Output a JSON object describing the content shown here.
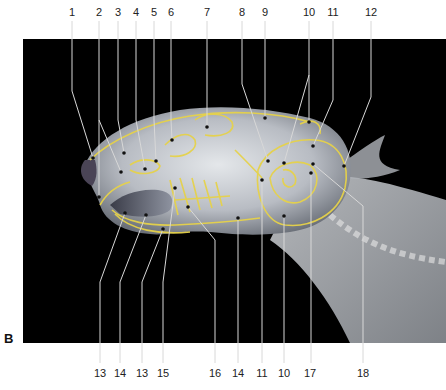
{
  "figure": {
    "panel_letter": "B",
    "colors": {
      "background": "#000000",
      "outline": "#e6d24a",
      "leader": "#d8d8d8",
      "bone_light": "#d9dce0",
      "bone_mid": "#9aa0a8",
      "bone_dark": "#5a5f68"
    },
    "top_labels": [
      {
        "text": "1",
        "x": 72,
        "dot": [
          93,
          158
        ],
        "bend": [
          72,
          91
        ]
      },
      {
        "text": "2",
        "x": 99,
        "dot": [
          121,
          172
        ],
        "bend": [
          99,
          120
        ]
      },
      {
        "text": "3",
        "x": 118,
        "dot": [
          124,
          153
        ],
        "bend": [
          118,
          120
        ]
      },
      {
        "text": "4",
        "x": 136,
        "dot": [
          145,
          169
        ],
        "bend": [
          136,
          120
        ]
      },
      {
        "text": "5",
        "x": 154,
        "dot": [
          156,
          161
        ],
        "bend": [
          154,
          120
        ]
      },
      {
        "text": "6",
        "x": 171,
        "dot": [
          172,
          140
        ],
        "bend": [
          171,
          120
        ]
      },
      {
        "text": "7",
        "x": 207,
        "dot": [
          207,
          127
        ],
        "bend": [
          207,
          120
        ]
      },
      {
        "text": "8",
        "x": 242,
        "dot": [
          268,
          161
        ],
        "bend": [
          242,
          84
        ]
      },
      {
        "text": "9",
        "x": 265,
        "dot": [
          265,
          118
        ],
        "bend": [
          265,
          100
        ]
      },
      {
        "text": "10",
        "x": 309,
        "dot": [
          284,
          163
        ],
        "bend": [
          309,
          75
        ]
      },
      {
        "text": "11",
        "x": 333,
        "dot": [
          313,
          146
        ],
        "bend": [
          333,
          100
        ]
      },
      {
        "text": "12",
        "x": 371,
        "dot": [
          344,
          166
        ],
        "bend": [
          371,
          97
        ]
      }
    ],
    "extra_top_branches": [
      {
        "from_label": "2",
        "dot": [
          99,
          197
        ]
      },
      {
        "from_label": "10",
        "dot": [
          309,
          122
        ]
      }
    ],
    "bottom_labels": [
      {
        "text": "13",
        "x": 100,
        "dot": [
          125,
          213
        ],
        "bend": [
          100,
          282
        ]
      },
      {
        "text": "14",
        "x": 120,
        "dot": [
          146,
          215
        ],
        "bend": [
          120,
          282
        ]
      },
      {
        "text": "13",
        "x": 142,
        "dot": [
          163,
          229
        ],
        "bend": [
          142,
          282
        ]
      },
      {
        "text": "15",
        "x": 163,
        "dot": [
          175,
          188
        ],
        "bend": [
          163,
          282
        ]
      },
      {
        "text": "16",
        "x": 215,
        "dot": [
          188,
          207
        ],
        "bend": [
          215,
          240
        ]
      },
      {
        "text": "14",
        "x": 238,
        "dot": [
          238,
          218
        ],
        "bend": [
          238,
          240
        ]
      },
      {
        "text": "11",
        "x": 262,
        "dot": [
          262,
          180
        ],
        "bend": [
          262,
          240
        ]
      },
      {
        "text": "10",
        "x": 284,
        "dot": [
          284,
          216
        ],
        "bend": [
          284,
          240
        ]
      },
      {
        "text": "17",
        "x": 310,
        "dot": [
          311,
          173
        ],
        "bend": [
          311,
          240
        ]
      },
      {
        "text": "18",
        "x": 363,
        "dot": [
          313,
          164
        ],
        "bend": [
          363,
          206
        ]
      }
    ]
  }
}
